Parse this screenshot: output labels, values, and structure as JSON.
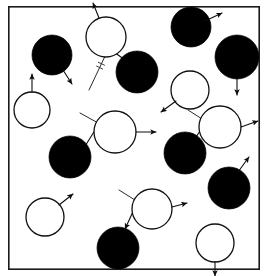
{
  "figure": {
    "kind": "schematic",
    "width": 267,
    "height": 276,
    "background_color": "#ffffff",
    "frame": {
      "name": "plot-border",
      "x": 8,
      "y": 6,
      "width": 252,
      "height": 264,
      "stroke_color": "#1a1a1a",
      "stroke_width": 1.6,
      "fill": "none"
    },
    "style": {
      "filled_particle_color": "#000000",
      "open_particle_fill": "#ffffff",
      "open_particle_stroke": "#111111",
      "particle_stroke_width": 1.3,
      "vector_color": "#0d0d0d",
      "vector_stroke_width": 1.1,
      "incoming_ray_color": "#2a2a2a",
      "incoming_ray_stroke_width": 1.0,
      "tick_mark_color": "#333333"
    }
  },
  "chart_data": {
    "type": "scatter",
    "xlabel": "",
    "ylabel": "",
    "grid": false,
    "legend": null,
    "xlim": [
      0,
      267
    ],
    "ylim": [
      0,
      276
    ],
    "particles": [
      {
        "id": "p1",
        "type": "filled",
        "cx": 52,
        "cy": 55,
        "r": 20,
        "label": "filled-particle-1"
      },
      {
        "id": "p2",
        "type": "open",
        "cx": 32,
        "cy": 110,
        "r": 18,
        "label": "open-particle-1"
      },
      {
        "id": "p3",
        "type": "open",
        "cx": 106,
        "cy": 37,
        "r": 20,
        "label": "open-particle-collision-a"
      },
      {
        "id": "p4",
        "type": "filled",
        "cx": 137,
        "cy": 72,
        "r": 21,
        "label": "filled-particle-collision-a"
      },
      {
        "id": "p5",
        "type": "filled",
        "cx": 191,
        "cy": 27,
        "r": 20,
        "label": "filled-particle-2"
      },
      {
        "id": "p6",
        "type": "filled",
        "cx": 237,
        "cy": 57,
        "r": 22,
        "label": "filled-particle-3"
      },
      {
        "id": "p7",
        "type": "open",
        "cx": 190,
        "cy": 90,
        "r": 19,
        "label": "open-particle-2"
      },
      {
        "id": "p8",
        "type": "open",
        "cx": 115,
        "cy": 132,
        "r": 21,
        "label": "open-particle-collision-b"
      },
      {
        "id": "p9",
        "type": "filled",
        "cx": 70,
        "cy": 157,
        "r": 21,
        "label": "filled-particle-collision-b"
      },
      {
        "id": "p10",
        "type": "open",
        "cx": 220,
        "cy": 127,
        "r": 21,
        "label": "open-particle-collision-c"
      },
      {
        "id": "p11",
        "type": "filled",
        "cx": 185,
        "cy": 153,
        "r": 21,
        "label": "filled-particle-collision-c"
      },
      {
        "id": "p12",
        "type": "filled",
        "cx": 229,
        "cy": 188,
        "r": 21,
        "label": "filled-particle-4"
      },
      {
        "id": "p13",
        "type": "open",
        "cx": 45,
        "cy": 217,
        "r": 19,
        "label": "open-particle-3"
      },
      {
        "id": "p14",
        "type": "open",
        "cx": 152,
        "cy": 209,
        "r": 20,
        "label": "open-particle-collision-d"
      },
      {
        "id": "p15",
        "type": "filled",
        "cx": 118,
        "cy": 248,
        "r": 21,
        "label": "filled-particle-collision-d"
      },
      {
        "id": "p16",
        "type": "open",
        "cx": 215,
        "cy": 243,
        "r": 19,
        "label": "open-particle-4"
      }
    ],
    "velocity_vectors": [
      {
        "id": "v1",
        "from": [
          63,
          70
        ],
        "to": [
          72,
          84
        ],
        "label": "velocity-filled-1"
      },
      {
        "id": "v2",
        "from": [
          32,
          92
        ],
        "to": [
          32,
          74
        ],
        "label": "velocity-open-1"
      },
      {
        "id": "v3",
        "from": [
          99,
          18
        ],
        "to": [
          93,
          3
        ],
        "label": "velocity-open-collision-a-in"
      },
      {
        "id": "v4",
        "from": [
          205,
          21
        ],
        "to": [
          222,
          13
        ],
        "label": "velocity-filled-2"
      },
      {
        "id": "v5",
        "from": [
          237,
          79
        ],
        "to": [
          237,
          95
        ],
        "label": "velocity-filled-3"
      },
      {
        "id": "v6",
        "from": [
          176,
          101
        ],
        "to": [
          161,
          112
        ],
        "label": "velocity-open-2"
      },
      {
        "id": "v7",
        "from": [
          136,
          132
        ],
        "to": [
          156,
          132
        ],
        "label": "velocity-open-collision-b-out"
      },
      {
        "id": "v8",
        "from": [
          241,
          127
        ],
        "to": [
          258,
          121
        ],
        "label": "velocity-open-collision-c-out"
      },
      {
        "id": "v9",
        "from": [
          238,
          172
        ],
        "to": [
          249,
          157
        ],
        "label": "velocity-filled-4"
      },
      {
        "id": "v10",
        "from": [
          59,
          205
        ],
        "to": [
          73,
          194
        ],
        "label": "velocity-open-3"
      },
      {
        "id": "v11",
        "from": [
          172,
          207
        ],
        "to": [
          187,
          203
        ],
        "label": "velocity-open-collision-d-out"
      },
      {
        "id": "v12",
        "from": [
          215,
          262
        ],
        "to": [
          215,
          276
        ],
        "label": "velocity-open-4"
      }
    ],
    "collisions": [
      {
        "id": "c1",
        "label": "collision-event-a",
        "open_particle": "p3",
        "filled_particle": "p4",
        "incoming_ray": {
          "from": [
            89,
            90
          ],
          "to": [
            107,
            52
          ]
        },
        "recoil_arrow": {
          "from": [
            111,
            50
          ],
          "to": [
            128,
            62
          ]
        },
        "tick_marks": 2
      },
      {
        "id": "c2",
        "label": "collision-event-b",
        "open_particle": "p8",
        "filled_particle": "p9",
        "incoming_ray": {
          "from": [
            80,
            113
          ],
          "to": [
            118,
            134
          ]
        },
        "recoil_arrow": {
          "from": [
            97,
            127
          ],
          "to": [
            82,
            151
          ]
        },
        "tick_marks": 3
      },
      {
        "id": "c3",
        "label": "collision-event-c",
        "open_particle": "p10",
        "filled_particle": "p11",
        "incoming_ray": {
          "from": [
            188,
            110
          ],
          "to": [
            224,
            133
          ]
        },
        "recoil_arrow": {
          "from": [
            206,
            122
          ],
          "to": [
            192,
            143
          ]
        },
        "tick_marks": 3
      },
      {
        "id": "c4",
        "label": "collision-event-d",
        "open_particle": "p14",
        "filled_particle": "p15",
        "incoming_ray": {
          "from": [
            119,
            190
          ],
          "to": [
            154,
            212
          ]
        },
        "recoil_arrow": {
          "from": [
            137,
            203
          ],
          "to": [
            125,
            229
          ]
        },
        "tick_marks": 3
      }
    ]
  }
}
